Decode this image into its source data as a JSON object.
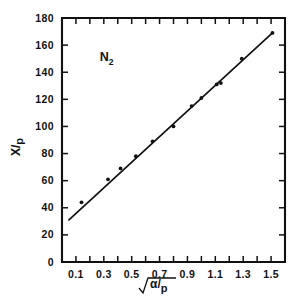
{
  "figure": {
    "background_color": "#ffffff",
    "ink_color": "#111111",
    "annotation": {
      "text": "N",
      "subscript": "2",
      "full": "N2"
    }
  },
  "chart_data": {
    "type": "scatter",
    "title": "",
    "subtitle": "",
    "annotations": [
      {
        "text": "N2",
        "x": 0.27,
        "y": 148
      }
    ],
    "xlabel": "sqrt(alpha/p)",
    "xlabel_parts": {
      "radical": "√",
      "numerator": "α",
      "slash": "/",
      "denominator": "p"
    },
    "ylabel": "X/p",
    "ylabel_parts": {
      "numerator": "X",
      "slash": "/",
      "denominator": "p"
    },
    "xlim": [
      0.0,
      1.6
    ],
    "ylim": [
      0,
      180
    ],
    "grid": false,
    "legend": null,
    "legend_position": "none",
    "xticks": [
      0.0,
      0.1,
      0.2,
      0.3,
      0.4,
      0.5,
      0.6,
      0.7,
      0.8,
      0.9,
      1.0,
      1.1,
      1.2,
      1.3,
      1.4,
      1.5,
      1.6
    ],
    "xticklabels": [
      "",
      "0.1",
      "",
      "0.3",
      "",
      "0.5",
      "",
      "0.7",
      "",
      "0.9",
      "",
      "1.1",
      "",
      "1.3",
      "",
      "1.5",
      ""
    ],
    "xticklabel_values": [
      "0.1",
      "0.3",
      "0.5",
      "0.7",
      "0.9",
      "1.1",
      "1.3",
      "1.5"
    ],
    "yticks": [
      0,
      20,
      40,
      60,
      80,
      100,
      120,
      140,
      160,
      180
    ],
    "yticklabels": [
      "0",
      "20",
      "40",
      "60",
      "80",
      "100",
      "120",
      "140",
      "160",
      "180"
    ],
    "series": [
      {
        "name": "measurements",
        "marker": "dot",
        "x": [
          0.14,
          0.33,
          0.42,
          0.53,
          0.65,
          0.8,
          0.93,
          1.0,
          1.11,
          1.14,
          1.29,
          1.51
        ],
        "y": [
          44,
          61,
          69,
          78,
          89,
          100,
          115,
          121,
          131,
          132,
          150,
          169
        ]
      },
      {
        "name": "fit-line",
        "type": "line",
        "x": [
          0.05,
          1.51
        ],
        "y": [
          31,
          169
        ]
      }
    ]
  }
}
